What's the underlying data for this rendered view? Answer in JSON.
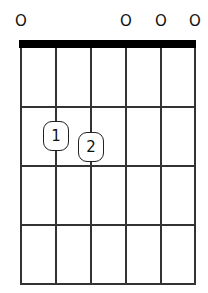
{
  "chord": {
    "strings": 6,
    "frets_shown": 4,
    "open_markers": [
      {
        "string": 1,
        "label": "O"
      },
      {
        "string": 4,
        "label": "O"
      },
      {
        "string": 5,
        "label": "O"
      },
      {
        "string": 6,
        "label": "O"
      }
    ],
    "fingers": [
      {
        "string": 2,
        "fret": 2,
        "label": "1"
      },
      {
        "string": 3,
        "fret": 2,
        "label": "2"
      }
    ]
  }
}
